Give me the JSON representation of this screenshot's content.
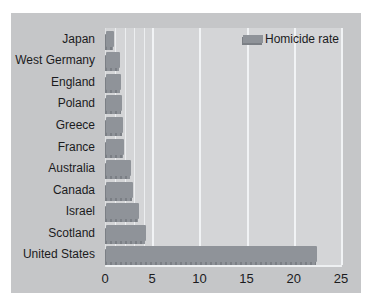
{
  "colors": {
    "page_bg": "#ffffff",
    "panel_bg": "#c5c6c8",
    "plot_bg": "#d4d5d7",
    "bar": "#8f9399",
    "bar_shadow": "#7b7f85",
    "gridline": "#eceef0",
    "text": "#1b1b1d"
  },
  "chart_data": {
    "type": "bar",
    "orientation": "horizontal",
    "title": "",
    "series_name": "Homicide rate",
    "categories": [
      "Japan",
      "West Germany",
      "England",
      "Poland",
      "Greece",
      "France",
      "Australia",
      "Canada",
      "Israel",
      "Scotland",
      "United States"
    ],
    "values": [
      0.9,
      1.5,
      1.6,
      1.7,
      1.8,
      1.9,
      2.6,
      2.9,
      3.5,
      4.2,
      22.3
    ],
    "xlim": [
      0,
      25
    ],
    "x_ticks": [
      0,
      5,
      10,
      15,
      20,
      25
    ],
    "minor_gridlines": [
      1,
      2,
      3,
      4
    ],
    "major_gridlines": [
      5,
      10,
      15,
      20,
      25
    ],
    "grid": true,
    "legend_position": "top-right",
    "xlabel": "",
    "ylabel": ""
  }
}
